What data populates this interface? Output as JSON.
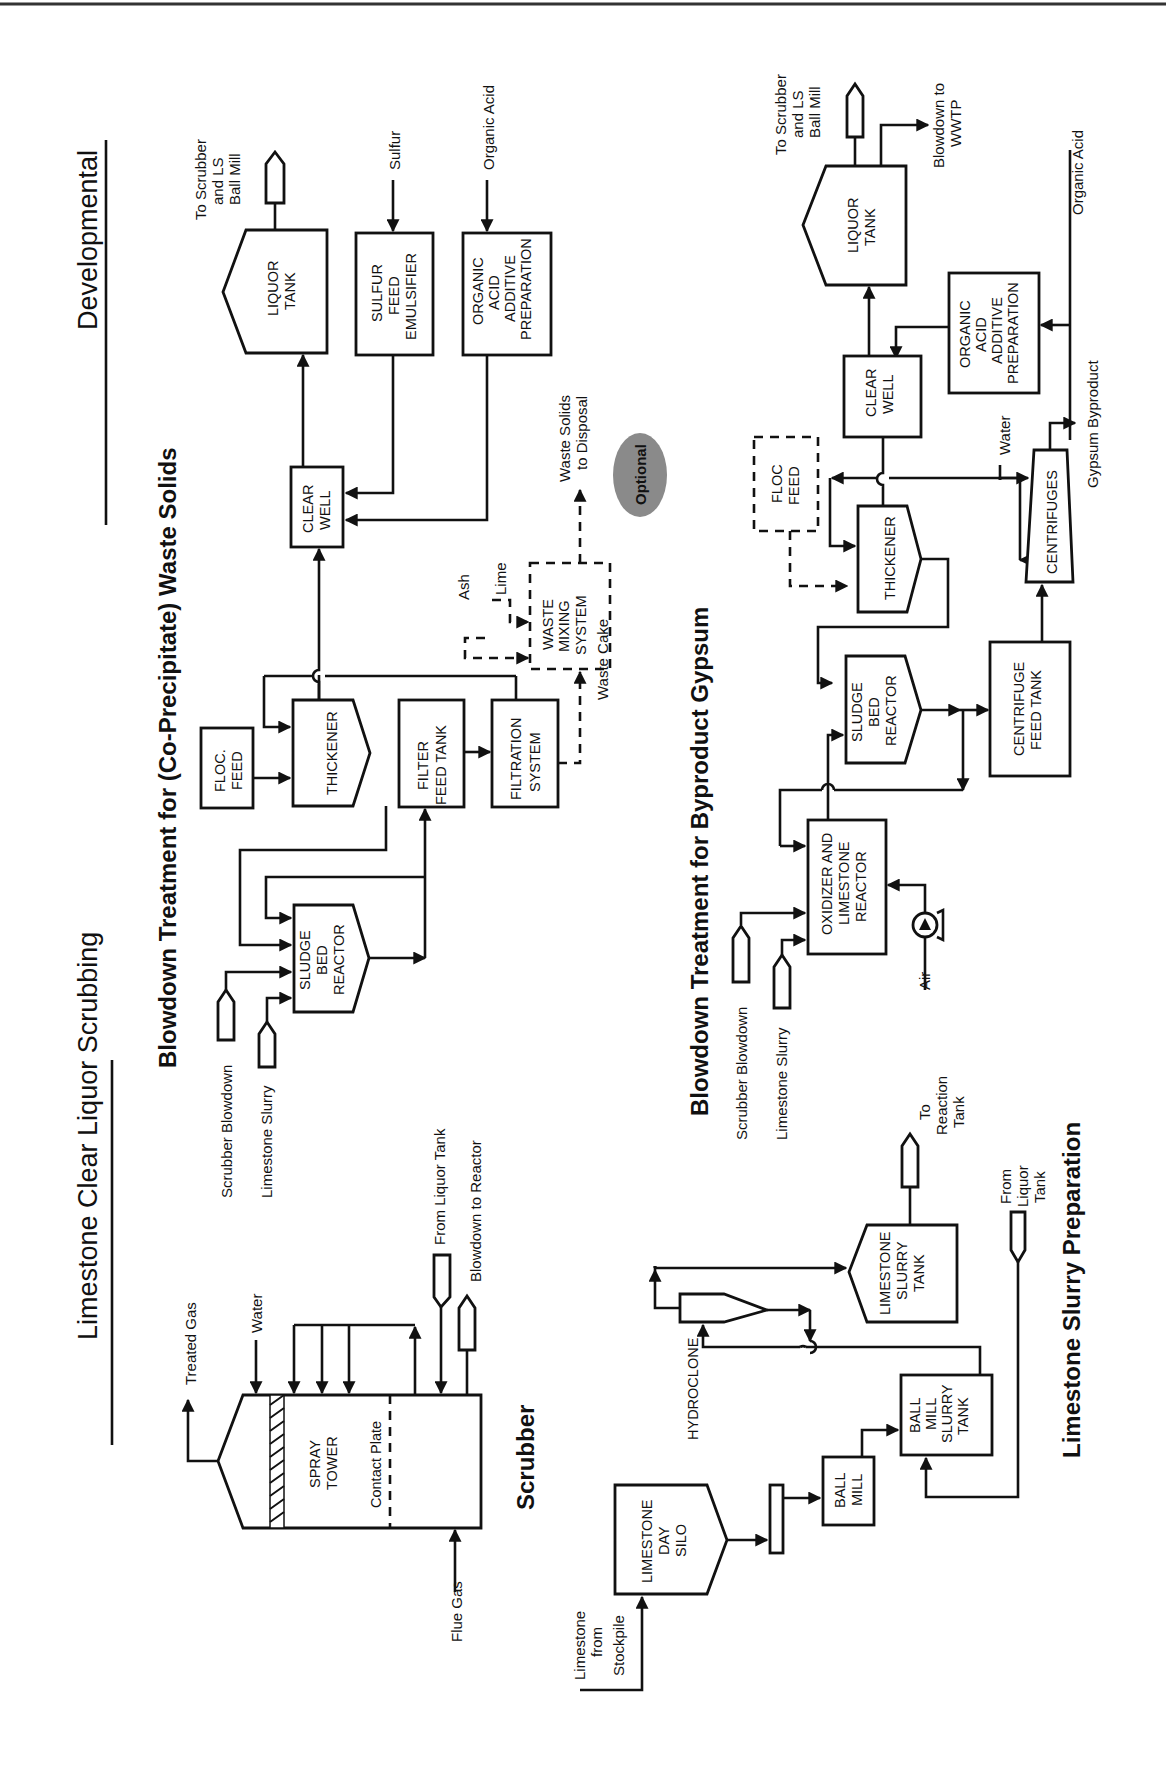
{
  "header": {
    "title": "Limestone Clear Liquor Scrubbing",
    "category": "Developmental"
  },
  "sections": {
    "waste_solids": {
      "title": "Blowdown Treatment for (Co-Precipitate) Waste Solids",
      "inputs": [
        "Scrubber Blowdown",
        "Limestone Slurry"
      ],
      "units": {
        "sludge_bed_reactor": [
          "SLUDGE",
          "BED",
          "REACTOR"
        ],
        "floc_feed": [
          "FLOC.",
          "FEED"
        ],
        "thickener": "THICKENER",
        "filter_feed_tank": [
          "FILTER",
          "FEED TANK"
        ],
        "filtration_system": [
          "FILTRATION",
          "SYSTEM"
        ],
        "clear_well": [
          "CLEAR",
          "WELL"
        ],
        "liquor_tank": [
          "LIQUOR",
          "TANK"
        ],
        "sulfur_feed_emulsifier": [
          "SULFUR",
          "FEED",
          "EMULSIFIER"
        ],
        "organic_acid_prep": [
          "ORGANIC",
          "ACID",
          "ADDITIVE",
          "PREPARATION"
        ],
        "waste_mixing_system": [
          "WASTE",
          "MIXING",
          "SYSTEM"
        ]
      },
      "streams": {
        "liquor_out": [
          "To Scrubber",
          "and LS",
          "Ball Mill"
        ],
        "sulfur": "Sulfur",
        "organic_acid": "Organic Acid",
        "ash": "Ash",
        "lime": "Lime",
        "waste_cake": "Waste Cake",
        "waste_out": [
          "Waste Solids",
          "to Disposal"
        ]
      },
      "badge": "Optional",
      "badge_color": "#8a8a8a"
    },
    "gypsum": {
      "title": "Blowdown Treatment for Byproduct Gypsum",
      "inputs": [
        "Scrubber Blowdown",
        "Limestone Slurry"
      ],
      "units": {
        "oxidizer": [
          "OXIDIZER AND",
          "LIMESTONE",
          "REACTOR"
        ],
        "sludge_bed_reactor": [
          "SLUDGE",
          "BED",
          "REACTOR"
        ],
        "floc_feed": [
          "FLOC",
          "FEED"
        ],
        "thickener": "THICKENER",
        "centrifuge_feed_tank": [
          "CENTRIFUGE",
          "FEED TANK"
        ],
        "centrifuges": "CENTRIFUGES",
        "clear_well": [
          "CLEAR",
          "WELL"
        ],
        "liquor_tank": [
          "LIQUOR",
          "TANK"
        ],
        "organic_acid_prep": [
          "ORGANIC",
          "ACID",
          "ADDITIVE",
          "PREPARATION"
        ]
      },
      "streams": {
        "air": "Air",
        "water": "Water",
        "gypsum_out": "Gypsum Byproduct",
        "organic_acid": "Organic Acid",
        "liquor_out": [
          "To Scrubber",
          "and LS",
          "Ball Mill"
        ],
        "blowdown_out": [
          "Blowdown to",
          "WWTP"
        ]
      }
    },
    "scrubber": {
      "title": "Scrubber",
      "unit": [
        "SPRAY",
        "TOWER"
      ],
      "contact_plate": "Contact Plate",
      "streams": {
        "treated_gas": "Treated Gas",
        "water": "Water",
        "flue_gas": "Flue Gas",
        "from_liquor_tank": "From Liquor Tank",
        "blowdown_to_reactor": "Blowdown to Reactor"
      }
    },
    "slurry_prep": {
      "title": "Limestone Slurry Preparation",
      "units": {
        "day_silo": [
          "LIMESTONE",
          "DAY",
          "SILO"
        ],
        "ball_mill": [
          "BALL",
          "MILL"
        ],
        "ball_mill_slurry_tank": [
          "BALL",
          "MILL",
          "SLURRY",
          "TANK"
        ],
        "hydroclone": "HYDROCLONE",
        "limestone_slurry_tank": [
          "LIMESTONE",
          "SLURRY",
          "TANK"
        ]
      },
      "streams": {
        "stockpile": [
          "Limestone",
          "from",
          "Stockpile"
        ],
        "to_reaction_tank": [
          "To",
          "Reaction",
          "Tank"
        ],
        "from_liquor_tank": [
          "From",
          "Liquor",
          "Tank"
        ]
      }
    }
  }
}
